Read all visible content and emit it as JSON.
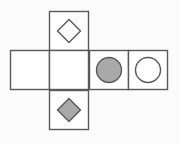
{
  "figure": {
    "name": "cube-net",
    "background_color": "#fbfbfb",
    "stroke_color": "#595959",
    "stroke_width": 1.4,
    "cell_size": 39,
    "fill_gray": "#a9a9a9",
    "fill_white": "#ffffff"
  },
  "grid": {
    "origin_x": 10.5,
    "origin_y": 11.5,
    "row_y": 50.5,
    "columns": 4,
    "column_x": [
      10.5,
      49.5,
      89.5,
      128.5
    ]
  },
  "cells": [
    {
      "id": "cell-top",
      "position": "top",
      "col": 1,
      "row": 0,
      "x": 49.5,
      "y": 11.5,
      "shape": "diamond",
      "shape_fill": "white",
      "shape_size": 23
    },
    {
      "id": "cell-row-1",
      "position": "row-left-1",
      "col": 0,
      "row": 1,
      "x": 10.5,
      "y": 50.5,
      "shape": "none",
      "shape_fill": "none",
      "shape_size": 0
    },
    {
      "id": "cell-row-2",
      "position": "row-left-2",
      "col": 1,
      "row": 1,
      "x": 49.5,
      "y": 50.5,
      "shape": "none",
      "shape_fill": "none",
      "shape_size": 0
    },
    {
      "id": "cell-row-3",
      "position": "row-left-3",
      "col": 2,
      "row": 1,
      "x": 89.5,
      "y": 50.5,
      "shape": "circle",
      "shape_fill": "gray",
      "shape_size": 25
    },
    {
      "id": "cell-row-4",
      "position": "row-left-4",
      "col": 3,
      "row": 1,
      "x": 128.5,
      "y": 50.5,
      "shape": "circle",
      "shape_fill": "white",
      "shape_size": 25
    },
    {
      "id": "cell-bottom",
      "position": "bottom",
      "col": 1,
      "row": 2,
      "x": 49.5,
      "y": 90.5,
      "shape": "diamond",
      "shape_fill": "gray",
      "shape_size": 23
    }
  ]
}
